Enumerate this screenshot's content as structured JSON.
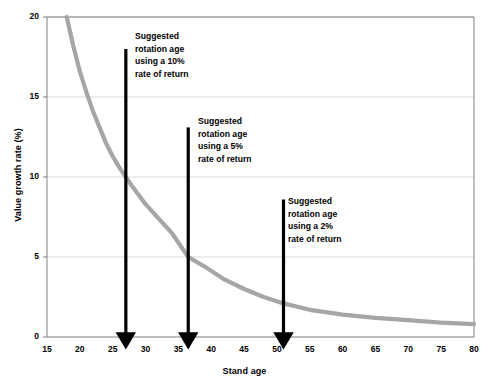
{
  "chart_data": {
    "type": "line",
    "title": "",
    "xlabel": "Stand age",
    "ylabel": "Value growth rate (%)",
    "xlim": [
      15,
      80
    ],
    "ylim": [
      0,
      20
    ],
    "xticks": [
      15,
      20,
      25,
      30,
      35,
      40,
      45,
      50,
      55,
      60,
      65,
      70,
      75,
      80
    ],
    "yticks": [
      0,
      5,
      10,
      15,
      20
    ],
    "grid": "horizontal",
    "legend": "none",
    "series": [
      {
        "name": "Value growth rate",
        "color": "#a6a6a6",
        "x": [
          18,
          19,
          20,
          21,
          22,
          23,
          24,
          25,
          26,
          27,
          28,
          30,
          32,
          34,
          36.5,
          39,
          42,
          45,
          48,
          51,
          55,
          60,
          65,
          70,
          75,
          80
        ],
        "y": [
          20.0,
          18.2,
          16.6,
          15.3,
          14.1,
          13.1,
          12.1,
          11.3,
          10.6,
          10.0,
          9.4,
          8.3,
          7.4,
          6.5,
          5.0,
          4.4,
          3.6,
          3.0,
          2.5,
          2.1,
          1.7,
          1.4,
          1.2,
          1.05,
          0.9,
          0.8
        ]
      }
    ],
    "annotations": [
      {
        "name": "suggested-rotation-age-10-percent",
        "arrow_x": 27,
        "arrow_top_value": 18,
        "arrow_bottom_value": 0,
        "color": "#000000",
        "lines": [
          "Suggested",
          "rotation age",
          "using a 10%",
          "rate of return"
        ]
      },
      {
        "name": "suggested-rotation-age-5-percent",
        "arrow_x": 36.5,
        "arrow_top_value": 13.1,
        "arrow_bottom_value": 0,
        "color": "#000000",
        "lines": [
          "Suggested",
          "rotation age",
          "using a 5%",
          "rate of return"
        ]
      },
      {
        "name": "suggested-rotation-age-2-percent",
        "arrow_x": 51,
        "arrow_top_value": 8.6,
        "arrow_bottom_value": 0,
        "color": "#000000",
        "lines": [
          "Suggested",
          "rotation age",
          "using a 2%",
          "rate of return"
        ]
      }
    ]
  },
  "axes": {
    "y_title": "Value growth rate (%)",
    "x_title": "Stand age",
    "y_tick_labels": [
      "20",
      "15",
      "10",
      "5",
      "0"
    ],
    "x_tick_labels": [
      "15",
      "20",
      "25",
      "30",
      "35",
      "40",
      "45",
      "50",
      "55",
      "60",
      "65",
      "70",
      "75",
      "80"
    ]
  },
  "annotation_text": {
    "a1": {
      "l1": "Suggested",
      "l2": "rotation age",
      "l3": "using a 10%",
      "l4": "rate of return"
    },
    "a2": {
      "l1": "Suggested",
      "l2": "rotation age",
      "l3": "using a 5%",
      "l4": "rate of return"
    },
    "a3": {
      "l1": "Suggested",
      "l2": "rotation age",
      "l3": "using a 2%",
      "l4": "rate of return"
    }
  },
  "colors": {
    "curve": "#a6a6a6",
    "arrow": "#000000",
    "grid": "#d9d9d9",
    "axis": "#808080",
    "background": "#ffffff"
  }
}
